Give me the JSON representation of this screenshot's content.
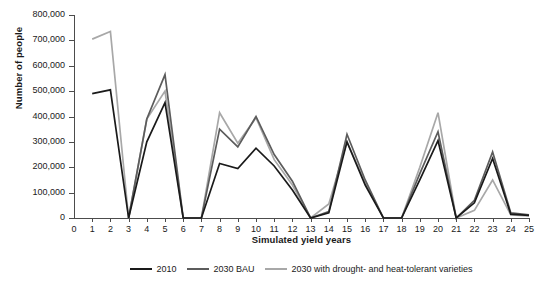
{
  "chart_data": {
    "type": "line",
    "title": "",
    "xlabel": "Simulated yield years",
    "ylabel": "Number of people",
    "xlim": [
      0,
      25
    ],
    "ylim": [
      0,
      800000
    ],
    "grid": false,
    "legend_position": "bottom",
    "x_ticks": [
      "0",
      "1",
      "2",
      "3",
      "4",
      "5",
      "6",
      "7",
      "8",
      "9",
      "10",
      "11",
      "12",
      "13",
      "14",
      "15",
      "16",
      "17",
      "18",
      "19",
      "20",
      "21",
      "22",
      "23",
      "24",
      "25"
    ],
    "y_ticks": [
      "0",
      "100,000",
      "200,000",
      "300,000",
      "400,000",
      "500,000",
      "600,000",
      "700,000",
      "800,000"
    ],
    "y_tick_values": [
      0,
      100000,
      200000,
      300000,
      400000,
      500000,
      600000,
      700000,
      800000
    ],
    "x": [
      1,
      2,
      3,
      4,
      5,
      6,
      7,
      8,
      9,
      10,
      11,
      12,
      13,
      14,
      15,
      16,
      17,
      18,
      19,
      20,
      21,
      22,
      23,
      24,
      25
    ],
    "series": [
      {
        "name": "2010",
        "color": "#1a1a1a",
        "values": [
          490000,
          505000,
          0,
          300000,
          455000,
          0,
          0,
          215000,
          195000,
          275000,
          205000,
          110000,
          0,
          20000,
          300000,
          130000,
          0,
          0,
          150000,
          305000,
          0,
          60000,
          235000,
          15000,
          10000
        ]
      },
      {
        "name": "2030 BAU",
        "color": "#5c5c5c",
        "values": [
          null,
          null,
          0,
          390000,
          565000,
          0,
          0,
          350000,
          280000,
          400000,
          250000,
          145000,
          0,
          25000,
          330000,
          150000,
          0,
          0,
          175000,
          340000,
          0,
          70000,
          260000,
          20000,
          12000
        ]
      },
      {
        "name": "2030 with drought- and heat-tolerant varieties",
        "color": "#a8a8a8",
        "values": [
          705000,
          735000,
          0,
          390000,
          500000,
          0,
          0,
          415000,
          295000,
          395000,
          230000,
          130000,
          0,
          55000,
          300000,
          140000,
          0,
          0,
          200000,
          415000,
          0,
          30000,
          150000,
          12000,
          8000
        ]
      }
    ]
  },
  "legend": {
    "items": [
      {
        "label": "2010",
        "color": "#1a1a1a"
      },
      {
        "label": "2030 BAU",
        "color": "#5c5c5c"
      },
      {
        "label": "2030 with drought- and heat-tolerant varieties",
        "color": "#a8a8a8"
      }
    ]
  }
}
